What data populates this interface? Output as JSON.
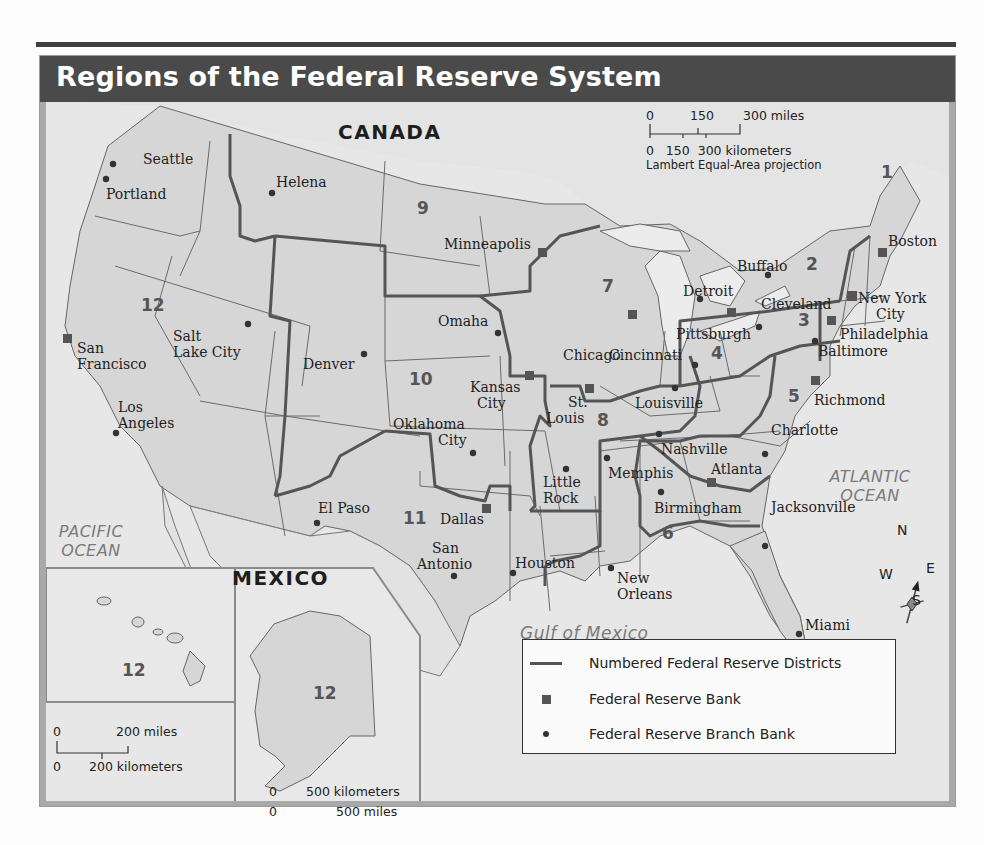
{
  "title": "Regions of the Federal Reserve System",
  "countries": [
    "CANADA",
    "MEXICO"
  ],
  "oceans": {
    "pacific": "PACIFIC OCEAN",
    "atlantic": "ATLANTIC OCEAN",
    "gulf": "Gulf of Mexico"
  },
  "scale_main": {
    "miles": [
      "0",
      "150",
      "300 miles"
    ],
    "km": "0   150  300 kilometers",
    "projection": "Lambert Equal-Area projection"
  },
  "scale_hawaii": {
    "miles_0": "0",
    "miles": "200 miles",
    "km_0": "0",
    "km": "200 kilometers"
  },
  "scale_alaska": {
    "miles_0": "0",
    "miles": "500 miles",
    "km_0": "0",
    "km": "500 kilometers"
  },
  "compass": {
    "n": "N",
    "s": "S",
    "e": "E",
    "w": "W"
  },
  "districts": [
    "1",
    "2",
    "3",
    "4",
    "5",
    "6",
    "7",
    "8",
    "9",
    "10",
    "11",
    "12"
  ],
  "inset_districts": {
    "hawaii": "12",
    "alaska": "12"
  },
  "banks": [
    "Boston",
    "New York City",
    "Philadelphia",
    "Cleveland",
    "Richmond",
    "Atlanta",
    "Chicago",
    "St. Louis",
    "Minneapolis",
    "Kansas City",
    "Dallas",
    "San Francisco"
  ],
  "branches": [
    "Seattle",
    "Portland",
    "Helena",
    "Salt Lake City",
    "Los Angeles",
    "Denver",
    "Omaha",
    "Oklahoma City",
    "El Paso",
    "San Antonio",
    "Houston",
    "Little Rock",
    "Memphis",
    "Nashville",
    "Louisville",
    "Birmingham",
    "New Orleans",
    "Jacksonville",
    "Miami",
    "Charlotte",
    "Baltimore",
    "Pittsburgh",
    "Cincinnati",
    "Detroit",
    "Buffalo"
  ],
  "labels": {
    "seattle": "Seattle",
    "portland": "Portland",
    "helena": "Helena",
    "minneapolis": "Minneapolis",
    "boston": "Boston",
    "buffalo": "Buffalo",
    "detroit": "Detroit",
    "cleveland": "Cleveland",
    "new_york_1": "New York",
    "new_york_2": "City",
    "philadelphia": "Philadelphia",
    "baltimore": "Baltimore",
    "pittsburgh": "Pittsburgh",
    "chicago": "Chicago",
    "cincinnati": "Cincinnati",
    "omaha": "Omaha",
    "salt_lake_1": "Salt",
    "salt_lake_2": "Lake City",
    "san_francisco_1": "San",
    "san_francisco_2": "Francisco",
    "denver": "Denver",
    "kansas_city_1": "Kansas",
    "kansas_city_2": "City",
    "st_louis_1": "St.",
    "st_louis_2": "Louis",
    "louisville": "Louisville",
    "richmond": "Richmond",
    "los_angeles_1": "Los",
    "los_angeles_2": "Angeles",
    "oklahoma_1": "Oklahoma",
    "oklahoma_2": "City",
    "charlotte": "Charlotte",
    "nashville": "Nashville",
    "memphis": "Memphis",
    "atlanta": "Atlanta",
    "little_rock_1": "Little",
    "little_rock_2": "Rock",
    "birmingham": "Birmingham",
    "el_paso": "El Paso",
    "dallas": "Dallas",
    "jacksonville": "Jacksonville",
    "san_antonio_1": "San",
    "san_antonio_2": "Antonio",
    "houston": "Houston",
    "new_orleans_1": "New",
    "new_orleans_2": "Orleans",
    "miami": "Miami"
  },
  "legend": {
    "districts": "Numbered Federal Reserve Districts",
    "bank": "Federal Reserve Bank",
    "branch": "Federal Reserve Branch Bank"
  },
  "colors": {
    "title_bar": "#4a4a4a",
    "land": "#d6d6d6",
    "water": "#ececec",
    "district_line": "#555555",
    "state_line": "#6a6a6a"
  }
}
